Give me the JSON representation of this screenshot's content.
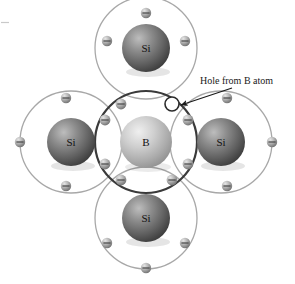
{
  "figure": {
    "name": "boron-doped-silicon-lattice",
    "width": 295,
    "height": 284,
    "background": "#ffffff"
  },
  "colors": {
    "silicon_core_light": "#b9b9b9",
    "silicon_core_dark": "#4a4a4a",
    "boron_core_light": "#e2e2e2",
    "boron_core_dark": "#8e8e8e",
    "silicon_ring": "#a8a8a8",
    "boron_ring": "#3a3a3a",
    "electron_light": "#d6d6d6",
    "electron_dark": "#6f6f6f",
    "hole_fill": "#ffffff",
    "hole_stroke": "#2b2b2b",
    "text": "#1a1a1a",
    "arrow": "#1a1a1a"
  },
  "atoms": [
    {
      "id": "si-top",
      "label": "Si",
      "element": "silicon",
      "cx": 146,
      "cy": 48,
      "r": 24,
      "ring_r": 51
    },
    {
      "id": "si-left",
      "label": "Si",
      "element": "silicon",
      "cx": 71,
      "cy": 142,
      "r": 24,
      "ring_r": 51
    },
    {
      "id": "boron",
      "label": "B",
      "element": "boron",
      "cx": 146,
      "cy": 142,
      "r": 26,
      "ring_r": 51
    },
    {
      "id": "si-right",
      "label": "Si",
      "element": "silicon",
      "cx": 221,
      "cy": 142,
      "r": 24,
      "ring_r": 51
    },
    {
      "id": "si-bottom",
      "label": "Si",
      "element": "silicon",
      "cx": 146,
      "cy": 218,
      "r": 24,
      "ring_r": 51
    }
  ],
  "electrons": {
    "symbol": "minus-sign",
    "count": 19,
    "positions": [
      {
        "x": 146,
        "y": 13,
        "group": "si-top-outer"
      },
      {
        "x": 107,
        "y": 41,
        "group": "si-top-outer"
      },
      {
        "x": 185,
        "y": 41,
        "group": "si-top-outer"
      },
      {
        "x": 20,
        "y": 142,
        "group": "si-left-outer"
      },
      {
        "x": 66,
        "y": 98,
        "group": "si-left-outer"
      },
      {
        "x": 66,
        "y": 186,
        "group": "si-left-outer"
      },
      {
        "x": 272,
        "y": 142,
        "group": "si-right-outer"
      },
      {
        "x": 227,
        "y": 98,
        "group": "si-right-outer"
      },
      {
        "x": 227,
        "y": 186,
        "group": "si-right-outer"
      },
      {
        "x": 146,
        "y": 268,
        "group": "si-bottom-outer"
      },
      {
        "x": 107,
        "y": 243,
        "group": "si-bottom-outer"
      },
      {
        "x": 185,
        "y": 243,
        "group": "si-bottom-outer"
      },
      {
        "x": 121,
        "y": 104,
        "group": "bond-top-left"
      },
      {
        "x": 105,
        "y": 120,
        "group": "bond-left-top"
      },
      {
        "x": 105,
        "y": 164,
        "group": "bond-left-bottom"
      },
      {
        "x": 121,
        "y": 180,
        "group": "bond-bottom-left"
      },
      {
        "x": 172,
        "y": 180,
        "group": "bond-bottom-right"
      },
      {
        "x": 188,
        "y": 164,
        "group": "bond-right-bottom"
      },
      {
        "x": 188,
        "y": 120,
        "group": "bond-right-top"
      }
    ]
  },
  "hole": {
    "label": "hole",
    "x": 172,
    "y": 104,
    "r": 7,
    "fill": "#ffffff",
    "stroke": "#2b2b2b"
  },
  "annotation": {
    "text": "Hole from B atom",
    "text_x": 200,
    "text_y": 84,
    "font_size": 10,
    "arrow": {
      "x1": 232,
      "y1": 88,
      "x2": 181,
      "y2": 105
    }
  }
}
